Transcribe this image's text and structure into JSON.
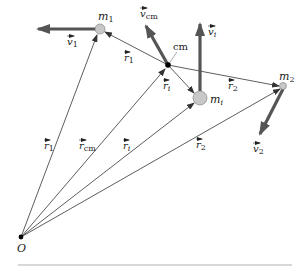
{
  "diagram": {
    "type": "center-of-mass vectors",
    "origin": {
      "label": "O",
      "x": 21,
      "y": 237
    },
    "masses": [
      {
        "id": "m1",
        "label": "m",
        "sub": "1",
        "x": 100,
        "y": 29,
        "r": 5
      },
      {
        "id": "mi",
        "label": "m",
        "sub": "i",
        "x": 200,
        "y": 98,
        "r": 7
      },
      {
        "id": "m2",
        "label": "m",
        "sub": "2",
        "x": 283,
        "y": 86,
        "r": 3.5
      }
    ],
    "cm": {
      "label": "cm",
      "x": 168,
      "y": 65
    },
    "position_vectors": [
      {
        "id": "r1",
        "label": "r",
        "sub": "1"
      },
      {
        "id": "rcm",
        "label": "r",
        "sub": "cm"
      },
      {
        "id": "ri",
        "label": "r",
        "sub": "i"
      },
      {
        "id": "r2",
        "label": "r",
        "sub": "2"
      }
    ],
    "relative_vectors": [
      {
        "id": "r1p",
        "label": "r",
        "sub": "1",
        "prime": "′"
      },
      {
        "id": "rip",
        "label": "r",
        "sub": "i",
        "prime": "′"
      },
      {
        "id": "r2p",
        "label": "r",
        "sub": "2",
        "prime": "′"
      }
    ],
    "velocity_vectors": [
      {
        "id": "v1",
        "label": "v",
        "sub": "1"
      },
      {
        "id": "vcm",
        "label": "v",
        "sub": "cm"
      },
      {
        "id": "vi",
        "label": "v",
        "sub": "i"
      },
      {
        "id": "v2",
        "label": "v",
        "sub": "2"
      }
    ],
    "colors": {
      "mass_fill": "#c8c8c8",
      "velocity": "#555555",
      "line": "#333333",
      "rule": "#d8d8d8"
    }
  }
}
